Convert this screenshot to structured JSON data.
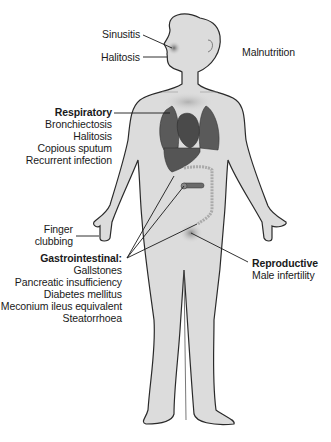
{
  "figure": {
    "colors": {
      "body_fill": "#dcdcdc",
      "body_outline": "#2a2a2a",
      "organ_fill": "#5a5a5a",
      "organ_dark": "#444444",
      "leader_line": "#1a1a1a",
      "text": "#1a1a1a"
    }
  },
  "labels": {
    "sinusitis": "Sinusitis",
    "halitosis_head": "Halitosis",
    "malnutrition": "Malnutrition",
    "respiratory": {
      "heading": "Respiratory",
      "items": [
        "Bronchiectosis",
        "Halitosis",
        "Copious sputum",
        "Recurrent infection"
      ]
    },
    "finger_clubbing": [
      "Finger",
      "clubbing"
    ],
    "gastrointestinal": {
      "heading": "Gastrointestinal:",
      "items": [
        "Gallstones",
        "Pancreatic insufficiency",
        "Diabetes mellitus",
        "Meconium ileus equivalent",
        "Steatorrhoea"
      ]
    },
    "reproductive": {
      "heading": "Reproductive",
      "items": [
        "Male infertility"
      ]
    }
  }
}
